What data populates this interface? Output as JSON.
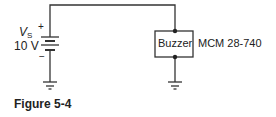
{
  "figure": {
    "caption": "Figure 5-4"
  },
  "source": {
    "symbol": "V",
    "subscript": "S",
    "value": "10 V",
    "positive_marker": "+",
    "negative_marker": "−"
  },
  "load": {
    "label": "Buzzer",
    "part_number": "MCM 28-740"
  },
  "colors": {
    "wire": "#333333",
    "text": "#222222",
    "background": "#ffffff"
  }
}
